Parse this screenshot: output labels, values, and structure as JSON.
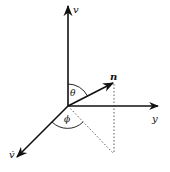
{
  "diagram": {
    "type": "3d-coordinate-axes",
    "axes": [
      {
        "id": "vertical",
        "label": "v"
      },
      {
        "id": "horizontal",
        "label": "y"
      },
      {
        "id": "diagonal",
        "label": "v̇"
      }
    ],
    "vector": {
      "label": "n"
    },
    "angles": [
      {
        "label": "θ",
        "between": [
          "vertical axis",
          "n"
        ]
      },
      {
        "label": "ϕ",
        "between": [
          "diagonal axis",
          "projection of n"
        ]
      }
    ],
    "colors": {
      "stroke": "#111111",
      "background": "#ffffff"
    }
  }
}
